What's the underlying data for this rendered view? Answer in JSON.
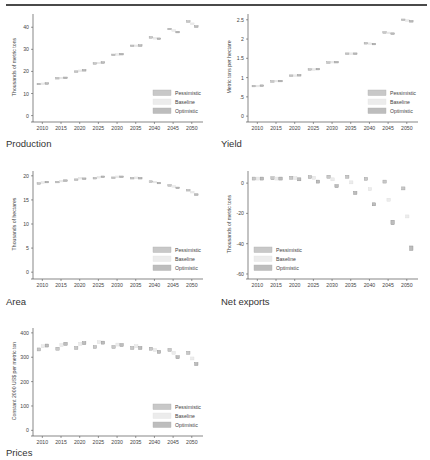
{
  "page": {
    "captions": [
      "Production",
      "Yield",
      "Area",
      "Net exports",
      "Prices"
    ]
  },
  "legend": {
    "labels": [
      "Pessimistic",
      "Baseline",
      "Optimistic"
    ],
    "colors": [
      "#c8c8c8",
      "#ececec",
      "#bdbdbd"
    ]
  },
  "chart_data": [
    {
      "id": "production",
      "type": "scatter",
      "title": "Production",
      "ylabel": "Thousands of metric tons",
      "xlabel": "",
      "x_ticks": [
        "2010",
        "2015",
        "2020",
        "2025",
        "2030",
        "2035",
        "2040",
        "2045",
        "2050"
      ],
      "ylim": [
        -2,
        46
      ],
      "y_ticks": [
        0,
        10,
        20,
        30,
        40
      ],
      "grid": false,
      "legend_position": "lower right",
      "categories": [
        2010,
        2015,
        2020,
        2025,
        2030,
        2035,
        2040,
        2045,
        2050
      ],
      "series": [
        {
          "name": "Pessimistic",
          "values": [
            14.3,
            16.9,
            19.9,
            23.6,
            27.5,
            31.6,
            35.4,
            39.2,
            42.6
          ]
        },
        {
          "name": "Baseline",
          "values": [
            14.4,
            17.0,
            20.3,
            23.8,
            27.7,
            31.6,
            35.0,
            38.5,
            41.6
          ]
        },
        {
          "name": "Optimistic",
          "values": [
            14.5,
            17.1,
            20.5,
            24.0,
            27.8,
            31.7,
            34.8,
            37.8,
            40.3
          ]
        }
      ]
    },
    {
      "id": "yield",
      "type": "scatter",
      "title": "Yield",
      "ylabel": "Metric tons per hectare",
      "xlabel": "",
      "x_ticks": [
        "2010",
        "2015",
        "2020",
        "2025",
        "2030",
        "2035",
        "2040",
        "2045",
        "2050"
      ],
      "ylim": [
        -0.1,
        2.65
      ],
      "y_ticks": [
        0,
        0.5,
        1,
        1.5,
        2,
        2.5
      ],
      "y_tick_labels": [
        "0",
        ".5",
        "1",
        "1.5",
        "2",
        "2.5"
      ],
      "grid": false,
      "legend_position": "lower right",
      "categories": [
        2010,
        2015,
        2020,
        2025,
        2030,
        2035,
        2040,
        2045,
        2050
      ],
      "series": [
        {
          "name": "Pessimistic",
          "values": [
            0.78,
            0.9,
            1.05,
            1.21,
            1.39,
            1.62,
            1.89,
            2.17,
            2.5
          ]
        },
        {
          "name": "Baseline",
          "values": [
            0.78,
            0.91,
            1.05,
            1.21,
            1.4,
            1.62,
            1.88,
            2.16,
            2.48
          ]
        },
        {
          "name": "Optimistic",
          "values": [
            0.79,
            0.91,
            1.06,
            1.22,
            1.4,
            1.62,
            1.87,
            2.14,
            2.46
          ]
        }
      ]
    },
    {
      "id": "area",
      "type": "scatter",
      "title": "Area",
      "ylabel": "Thousands of hectares",
      "xlabel": "",
      "x_ticks": [
        "2010",
        "2015",
        "2020",
        "2025",
        "2030",
        "2035",
        "2040",
        "2045",
        "2050"
      ],
      "ylim": [
        -1,
        21
      ],
      "y_ticks": [
        0,
        5,
        10,
        15,
        20
      ],
      "grid": false,
      "legend_position": "lower right",
      "categories": [
        2010,
        2015,
        2020,
        2025,
        2030,
        2035,
        2040,
        2045,
        2050
      ],
      "series": [
        {
          "name": "Pessimistic",
          "values": [
            18.4,
            18.7,
            19.2,
            19.5,
            19.6,
            19.5,
            18.8,
            18.0,
            17.0
          ]
        },
        {
          "name": "Baseline",
          "values": [
            18.6,
            18.9,
            19.5,
            19.7,
            19.8,
            19.6,
            18.7,
            17.8,
            16.6
          ]
        },
        {
          "name": "Optimistic",
          "values": [
            18.7,
            19.0,
            19.4,
            19.8,
            19.8,
            19.5,
            18.5,
            17.5,
            16.1
          ]
        }
      ]
    },
    {
      "id": "net_exports",
      "type": "scatter",
      "title": "Net exports",
      "ylabel": "Thousands of metric tons",
      "xlabel": "",
      "x_ticks": [
        "2010",
        "2015",
        "2020",
        "2025",
        "2030",
        "2035",
        "2040",
        "2045",
        "2050"
      ],
      "ylim": [
        -62,
        8
      ],
      "y_ticks": [
        0,
        -20,
        -40,
        -60
      ],
      "grid": false,
      "legend_position": "lower left",
      "categories": [
        2010,
        2015,
        2020,
        2025,
        2030,
        2035,
        2040,
        2045,
        2050
      ],
      "series": [
        {
          "name": "Pessimistic",
          "values": [
            3.0,
            3.2,
            3.5,
            4.0,
            4.2,
            4.2,
            2.8,
            1.0,
            -3.5
          ]
        },
        {
          "name": "Baseline",
          "values": [
            3.0,
            3.0,
            3.3,
            3.5,
            2.5,
            0.5,
            -4.0,
            -11.0,
            -22.0
          ]
        },
        {
          "name": "Optimistic",
          "values": [
            3.0,
            3.0,
            2.5,
            1.0,
            -2.0,
            -6.5,
            -14.0,
            -26.0,
            -43.0
          ]
        }
      ]
    },
    {
      "id": "prices",
      "type": "scatter",
      "title": "Prices",
      "ylabel": "Constant 2000 US$ per metric ton",
      "xlabel": "",
      "x_ticks": [
        "2010",
        "2015",
        "2020",
        "2025",
        "2030",
        "2035",
        "2040",
        "2045",
        "2050"
      ],
      "ylim": [
        -15,
        420
      ],
      "y_ticks": [
        0,
        100,
        200,
        300,
        400
      ],
      "grid": false,
      "legend_position": "lower right",
      "categories": [
        2010,
        2015,
        2020,
        2025,
        2030,
        2035,
        2040,
        2045,
        2050
      ],
      "series": [
        {
          "name": "Pessimistic",
          "values": [
            332,
            335,
            338,
            342,
            342,
            338,
            335,
            330,
            318
          ]
        },
        {
          "name": "Baseline",
          "values": [
            345,
            350,
            355,
            362,
            352,
            345,
            330,
            318,
            295
          ]
        },
        {
          "name": "Optimistic",
          "values": [
            348,
            355,
            358,
            360,
            350,
            338,
            322,
            300,
            272
          ]
        }
      ]
    }
  ]
}
